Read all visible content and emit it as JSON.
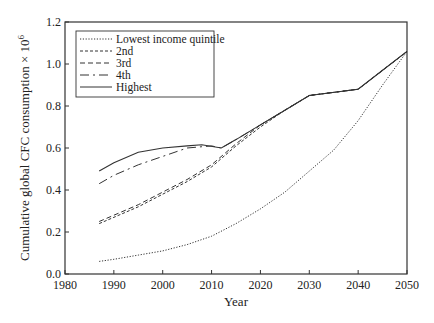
{
  "chart_data": {
    "type": "line",
    "title": "",
    "xlabel": "Year",
    "ylabel": "Cumulative global CFC consumption × 10⁶",
    "xlim": [
      1980,
      2050
    ],
    "ylim": [
      0.0,
      1.2
    ],
    "xticks": [
      1980,
      1990,
      2000,
      2010,
      2020,
      2030,
      2040,
      2050
    ],
    "yticks": [
      "0.0",
      "0.2",
      "0.4",
      "0.6",
      "0.8",
      "1.0",
      "1.2"
    ],
    "grid": false,
    "legend_position": "upper left",
    "series": [
      {
        "name": "Lowest income quintile",
        "style": "dotted",
        "x": [
          1987,
          1990,
          1995,
          2000,
          2005,
          2010,
          2015,
          2020,
          2025,
          2030,
          2035,
          2040,
          2045,
          2050
        ],
        "y": [
          0.06,
          0.07,
          0.09,
          0.11,
          0.14,
          0.18,
          0.24,
          0.31,
          0.39,
          0.49,
          0.59,
          0.73,
          0.9,
          1.06
        ]
      },
      {
        "name": "2nd",
        "style": "short-dash",
        "x": [
          1987,
          1990,
          1995,
          2000,
          2005,
          2010,
          2015,
          2020,
          2025,
          2030,
          2040,
          2045,
          2050
        ],
        "y": [
          0.24,
          0.27,
          0.32,
          0.38,
          0.44,
          0.51,
          0.61,
          0.7,
          0.78,
          0.85,
          0.88,
          0.97,
          1.06
        ]
      },
      {
        "name": "3rd",
        "style": "medium-dash",
        "x": [
          1987,
          1990,
          1995,
          2000,
          2005,
          2010,
          2015,
          2020,
          2025,
          2030,
          2040,
          2045,
          2050
        ],
        "y": [
          0.25,
          0.28,
          0.33,
          0.39,
          0.45,
          0.52,
          0.62,
          0.71,
          0.78,
          0.85,
          0.88,
          0.97,
          1.06
        ]
      },
      {
        "name": "4th",
        "style": "long-dash-dot",
        "x": [
          1987,
          1990,
          1995,
          2000,
          2005,
          2010,
          2012,
          2015,
          2020,
          2025,
          2030,
          2040,
          2045,
          2050
        ],
        "y": [
          0.43,
          0.47,
          0.52,
          0.56,
          0.6,
          0.61,
          0.6,
          0.64,
          0.71,
          0.78,
          0.85,
          0.88,
          0.97,
          1.06
        ]
      },
      {
        "name": "Highest",
        "style": "solid",
        "x": [
          1987,
          1990,
          1995,
          2000,
          2005,
          2008,
          2012,
          2015,
          2020,
          2025,
          2030,
          2040,
          2045,
          2050
        ],
        "y": [
          0.49,
          0.53,
          0.58,
          0.6,
          0.61,
          0.615,
          0.6,
          0.64,
          0.71,
          0.78,
          0.85,
          0.88,
          0.97,
          1.06
        ]
      }
    ]
  },
  "axes": {
    "x_label": "Year",
    "y_label_main": "Cumulative global CFC consumption × 10",
    "y_label_sup": "6"
  },
  "legend": {
    "items": [
      {
        "label": "Lowest income quintile"
      },
      {
        "label": "2nd"
      },
      {
        "label": "3rd"
      },
      {
        "label": "4th"
      },
      {
        "label": "Highest"
      }
    ]
  }
}
